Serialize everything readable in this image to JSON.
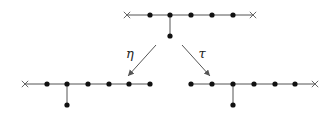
{
  "diagram": {
    "type": "dynkin-like graphs with maps",
    "colors": {
      "edge": "#555555",
      "node": "#111111",
      "cross": "#666666"
    },
    "graphs": [
      {
        "id": "top",
        "line": {
          "x1": 127,
          "x2": 253,
          "y": 15
        },
        "crosses": [
          127,
          253
        ],
        "nodes": [
          150,
          170,
          191,
          212,
          233
        ],
        "branch": {
          "x": 170,
          "y_from": 15,
          "y_to": 36
        }
      },
      {
        "id": "bottom-left",
        "line": {
          "x1": 25,
          "x2": 150,
          "y": 84
        },
        "crosses": [
          25
        ],
        "nodes": [
          47,
          67,
          88,
          109,
          129,
          150
        ],
        "branch": {
          "x": 67,
          "y_from": 84,
          "y_to": 105
        }
      },
      {
        "id": "bottom-right",
        "line": {
          "x1": 191,
          "x2": 315,
          "y": 84
        },
        "crosses": [
          315
        ],
        "nodes": [
          191,
          212,
          233,
          254,
          275,
          295
        ],
        "branch": {
          "x": 233,
          "y_from": 84,
          "y_to": 105
        }
      }
    ],
    "arrows": [
      {
        "id": "eta",
        "label": "η",
        "x1": 156,
        "y1": 45,
        "x2": 128,
        "y2": 76,
        "label_x": 130,
        "label_y": 58
      },
      {
        "id": "tau",
        "label": "τ",
        "x1": 182,
        "y1": 45,
        "x2": 210,
        "y2": 76,
        "label_x": 202,
        "label_y": 58
      }
    ]
  }
}
